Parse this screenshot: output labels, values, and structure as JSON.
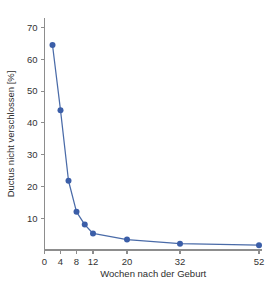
{
  "chart_data": {
    "type": "line",
    "title": "",
    "subtitle": "",
    "xlabel": "Wochen nach der Geburt",
    "ylabel": "Ductus nicht verschlossen [%]",
    "x": [
      2,
      4,
      6,
      8,
      10,
      12,
      20,
      32,
      52
    ],
    "values": [
      64.5,
      44,
      21.8,
      12,
      8,
      5.2,
      3.3,
      2,
      1.5
    ],
    "series": [
      {
        "name": "Ductus nicht verschlossen",
        "values": [
          64.5,
          44,
          21.8,
          12,
          8,
          5.2,
          3.3,
          2,
          1.5
        ]
      }
    ],
    "xticks": [
      0,
      4,
      8,
      12,
      20,
      32,
      52
    ],
    "xtick_labels": [
      "0",
      "4",
      "8",
      "12",
      "20",
      "32",
      "52"
    ],
    "yticks": [
      10,
      20,
      30,
      40,
      50,
      60,
      70
    ],
    "ytick_labels": [
      "10",
      "20",
      "30",
      "40",
      "50",
      "60",
      "70"
    ],
    "xlim": [
      0,
      56
    ],
    "ylim": [
      0,
      73
    ],
    "x_scale": "compressed",
    "grid": false,
    "legend": "none",
    "marker": "circle",
    "colors": {
      "series": "#3b5ea8",
      "line": "#4a6ba8",
      "axis": "#8d8d8d",
      "text": "#333333",
      "background": "#ffffff"
    }
  }
}
